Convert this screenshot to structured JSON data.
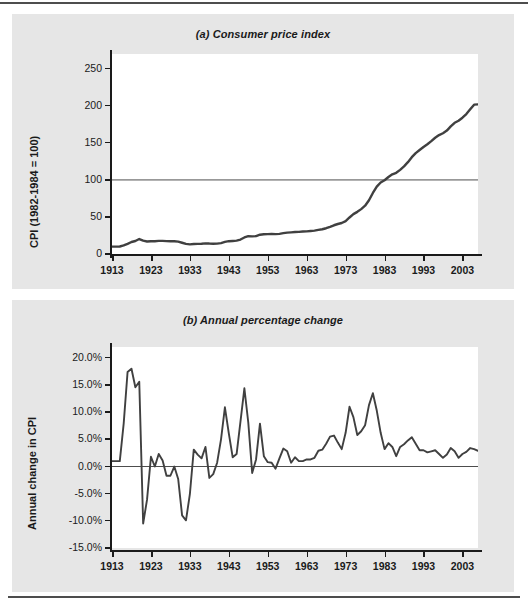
{
  "figure": {
    "panels": [
      {
        "id": "a",
        "title": "(a) Consumer price index",
        "ylabel": "CPI (1982-1984 = 100)",
        "xlabel": ""
      },
      {
        "id": "b",
        "title": "(b) Annual percentage change",
        "ylabel": "Annual change in CPI",
        "xlabel": ""
      }
    ],
    "line_color": "#404040",
    "reference_line_color": "#4d4d4d",
    "panel_background": "#e6e6e6",
    "plot_background": "#ffffff"
  },
  "chart_data": [
    {
      "type": "line",
      "title": "(a) Consumer price index",
      "xlabel": "",
      "ylabel": "CPI (1982-1984 = 100)",
      "xlim": [
        1913,
        2007
      ],
      "ylim": [
        0,
        270
      ],
      "ytick_labels": [
        "0",
        "50",
        "100",
        "150",
        "200",
        "250"
      ],
      "yticks": [
        0,
        50,
        100,
        150,
        200,
        250
      ],
      "xtick_labels": [
        "1913",
        "1923",
        "1933",
        "1943",
        "1953",
        "1963",
        "1973",
        "1983",
        "1993",
        "2003"
      ],
      "xticks": [
        1913,
        1923,
        1933,
        1943,
        1953,
        1963,
        1973,
        1983,
        1993,
        2003
      ],
      "grid": false,
      "reference_lines": [
        {
          "y": 100,
          "label": "100"
        }
      ],
      "legend": null,
      "series": [
        {
          "name": "Consumer price index",
          "x": [
            1913,
            1914,
            1915,
            1916,
            1917,
            1918,
            1919,
            1920,
            1921,
            1922,
            1923,
            1924,
            1925,
            1926,
            1927,
            1928,
            1929,
            1930,
            1931,
            1932,
            1933,
            1934,
            1935,
            1936,
            1937,
            1938,
            1939,
            1940,
            1941,
            1942,
            1943,
            1944,
            1945,
            1946,
            1947,
            1948,
            1949,
            1950,
            1951,
            1952,
            1953,
            1954,
            1955,
            1956,
            1957,
            1958,
            1959,
            1960,
            1961,
            1962,
            1963,
            1964,
            1965,
            1966,
            1967,
            1968,
            1969,
            1970,
            1971,
            1972,
            1973,
            1974,
            1975,
            1976,
            1977,
            1978,
            1979,
            1980,
            1981,
            1982,
            1983,
            1984,
            1985,
            1986,
            1987,
            1988,
            1989,
            1990,
            1991,
            1992,
            1993,
            1994,
            1995,
            1996,
            1997,
            1998,
            1999,
            2000,
            2001,
            2002,
            2003,
            2004,
            2005,
            2006,
            2007
          ],
          "values": [
            9.9,
            10.0,
            10.1,
            11.6,
            13.7,
            16.2,
            17.5,
            20.2,
            18.0,
            16.9,
            17.2,
            17.2,
            17.7,
            17.7,
            17.4,
            17.2,
            17.2,
            16.7,
            15.2,
            13.6,
            13.0,
            13.4,
            13.7,
            13.9,
            14.4,
            14.1,
            13.9,
            14.0,
            14.7,
            16.3,
            17.3,
            17.6,
            18.0,
            19.5,
            22.3,
            24.0,
            23.8,
            24.1,
            26.0,
            26.6,
            26.8,
            26.9,
            26.8,
            27.2,
            28.1,
            28.9,
            29.2,
            29.6,
            29.9,
            30.3,
            30.6,
            31.0,
            31.5,
            32.5,
            33.4,
            34.8,
            36.7,
            38.8,
            40.5,
            41.8,
            44.4,
            49.3,
            53.8,
            56.9,
            60.6,
            65.2,
            72.6,
            82.4,
            90.9,
            96.5,
            99.6,
            103.9,
            107.6,
            109.6,
            113.6,
            118.3,
            124.0,
            130.7,
            136.2,
            140.3,
            144.5,
            148.2,
            152.4,
            156.9,
            160.5,
            163.0,
            166.6,
            172.2,
            177.1,
            179.9,
            184.0,
            188.9,
            195.3,
            201.6,
            202.0
          ]
        }
      ]
    },
    {
      "type": "line",
      "title": "(b) Annual percentage change",
      "xlabel": "",
      "ylabel": "Annual change in CPI",
      "xlim": [
        1913,
        2007
      ],
      "ylim": [
        -15,
        22
      ],
      "ytick_labels": [
        "20.0%",
        "15.0%",
        "10.0%",
        "5.0%",
        "0.0%",
        "-5.0%",
        "-10.0%",
        "-15.0%"
      ],
      "yticks": [
        20,
        15,
        10,
        5,
        0,
        -5,
        -10,
        -15
      ],
      "xtick_labels": [
        "1913",
        "1923",
        "1933",
        "1943",
        "1953",
        "1963",
        "1973",
        "1983",
        "1993",
        "2003"
      ],
      "xticks": [
        1913,
        1923,
        1933,
        1943,
        1953,
        1963,
        1973,
        1983,
        1993,
        2003
      ],
      "grid": false,
      "reference_lines": [
        {
          "y": 0,
          "label": "0.0%"
        }
      ],
      "legend": null,
      "units": "percent",
      "series": [
        {
          "name": "Annual change in CPI",
          "x": [
            1913,
            1914,
            1915,
            1916,
            1917,
            1918,
            1919,
            1920,
            1921,
            1922,
            1923,
            1924,
            1925,
            1926,
            1927,
            1928,
            1929,
            1930,
            1931,
            1932,
            1933,
            1934,
            1935,
            1936,
            1937,
            1938,
            1939,
            1940,
            1941,
            1942,
            1943,
            1944,
            1945,
            1946,
            1947,
            1948,
            1949,
            1950,
            1951,
            1952,
            1953,
            1954,
            1955,
            1956,
            1957,
            1958,
            1959,
            1960,
            1961,
            1962,
            1963,
            1964,
            1965,
            1966,
            1967,
            1968,
            1969,
            1970,
            1971,
            1972,
            1973,
            1974,
            1975,
            1976,
            1977,
            1978,
            1979,
            1980,
            1981,
            1982,
            1983,
            1984,
            1985,
            1986,
            1987,
            1988,
            1989,
            1990,
            1991,
            1992,
            1993,
            1994,
            1995,
            1996,
            1997,
            1998,
            1999,
            2000,
            2001,
            2002,
            2003,
            2004,
            2005,
            2006,
            2007
          ],
          "values": [
            1.0,
            1.0,
            1.0,
            7.9,
            17.4,
            18.0,
            14.6,
            15.6,
            -10.5,
            -6.1,
            1.8,
            0.0,
            2.3,
            1.1,
            -1.7,
            -1.7,
            0.0,
            -2.3,
            -9.0,
            -9.9,
            -5.1,
            3.1,
            2.2,
            1.5,
            3.6,
            -2.1,
            -1.4,
            0.7,
            5.0,
            10.9,
            6.1,
            1.7,
            2.3,
            8.3,
            14.4,
            8.1,
            -1.2,
            1.3,
            7.9,
            1.9,
            0.8,
            0.7,
            -0.4,
            1.5,
            3.3,
            2.8,
            0.7,
            1.7,
            1.0,
            1.0,
            1.3,
            1.3,
            1.6,
            2.9,
            3.1,
            4.2,
            5.5,
            5.7,
            4.4,
            3.2,
            6.2,
            11.0,
            9.1,
            5.8,
            6.5,
            7.6,
            11.3,
            13.5,
            10.3,
            6.2,
            3.2,
            4.3,
            3.6,
            1.9,
            3.6,
            4.1,
            4.8,
            5.4,
            4.2,
            3.0,
            3.0,
            2.6,
            2.8,
            3.0,
            2.3,
            1.6,
            2.2,
            3.4,
            2.8,
            1.6,
            2.3,
            2.7,
            3.4,
            3.2,
            2.9
          ]
        }
      ]
    }
  ]
}
